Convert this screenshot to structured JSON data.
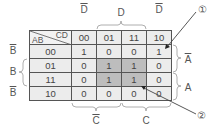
{
  "kmap": {
    "row_var": "AB",
    "col_var": "CD",
    "columns": [
      "00",
      "01",
      "11",
      "10"
    ],
    "rows": [
      {
        "label": "00",
        "cells": [
          "1",
          "0",
          "0",
          "1"
        ]
      },
      {
        "label": "01",
        "cells": [
          "0",
          "1",
          "1",
          "0"
        ]
      },
      {
        "label": "11",
        "cells": [
          "0",
          "1",
          "1",
          "0"
        ]
      },
      {
        "label": "10",
        "cells": [
          "0",
          "0",
          "0",
          "0"
        ]
      }
    ],
    "highlighted_cells": [
      [
        1,
        1
      ],
      [
        1,
        2
      ],
      [
        2,
        1
      ],
      [
        2,
        2
      ]
    ],
    "highlight_color": "#bdbdbd",
    "cell_color": "#ececec"
  },
  "top_labels": {
    "d_bar_left": "D",
    "d": "D",
    "d_bar_right": "D"
  },
  "left_labels": {
    "b_bar_top": "B",
    "b": "B",
    "b_bar_bottom": "B"
  },
  "right_labels": {
    "a_bar": "A",
    "a": "A"
  },
  "bottom_labels": {
    "c_bar": "C",
    "c": "C"
  },
  "callouts": {
    "one": "①",
    "two": "②"
  }
}
